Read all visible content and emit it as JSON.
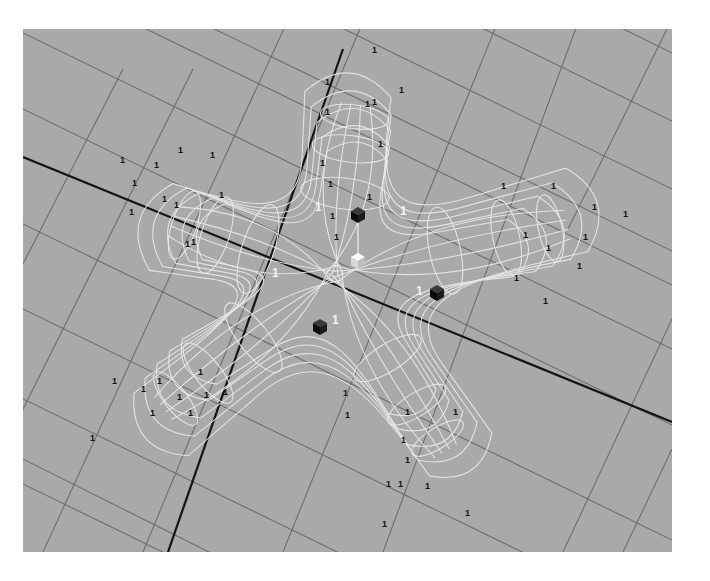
{
  "viewport": {
    "name": "perspective-viewport",
    "background": "#a9a9a9",
    "grid_color": "#6e6e6e",
    "axis_color": "#141414",
    "wire_color": "#e8e8e8"
  },
  "grid": {
    "lines": [
      [
        0,
        4,
        649,
        320
      ],
      [
        0,
        80,
        649,
        396
      ],
      [
        0,
        195,
        649,
        511
      ],
      [
        0,
        280,
        649,
        596
      ],
      [
        0,
        370,
        649,
        686
      ],
      [
        0,
        455,
        649,
        771
      ],
      [
        150,
        -20,
        649,
        222
      ],
      [
        280,
        -20,
        649,
        160
      ],
      [
        420,
        -20,
        649,
        92
      ],
      [
        560,
        -20,
        649,
        24
      ],
      [
        0,
        -60,
        649,
        256
      ],
      [
        -200,
        330,
        200,
        530
      ],
      [
        0,
        235,
        100,
        40
      ],
      [
        0,
        380,
        170,
        40
      ],
      [
        20,
        523,
        270,
        -20
      ],
      [
        120,
        523,
        345,
        -20
      ],
      [
        260,
        523,
        480,
        -20
      ],
      [
        360,
        523,
        560,
        -20
      ],
      [
        540,
        523,
        649,
        290
      ],
      [
        600,
        523,
        649,
        420
      ],
      [
        545,
        200,
        649,
        -10
      ]
    ],
    "axes": [
      [
        0,
        128,
        649,
        393
      ],
      [
        145,
        523,
        320,
        20
      ]
    ]
  },
  "starfish": {
    "center": [
      312,
      245
    ],
    "arms": [
      {
        "angle": -83,
        "length": 180,
        "width": 48
      },
      {
        "angle": -12,
        "length": 250,
        "width": 48
      },
      {
        "angle": 58,
        "length": 220,
        "width": 42
      },
      {
        "angle": 142,
        "length": 230,
        "width": 46
      },
      {
        "angle": 198,
        "length": 180,
        "width": 50
      }
    ],
    "layers": 5
  },
  "handles": [
    {
      "name": "cube-handle-black-top",
      "x": 335,
      "y": 186,
      "color": "#111111"
    },
    {
      "name": "cube-handle-white-center",
      "x": 335,
      "y": 232,
      "color": "#f2f2f2"
    },
    {
      "name": "cube-handle-black-right",
      "x": 414,
      "y": 264,
      "color": "#111111"
    },
    {
      "name": "cube-handle-black-left",
      "x": 297,
      "y": 298,
      "color": "#111111"
    }
  ],
  "pivot_line": [
    335,
    190,
    335,
    232
  ],
  "cv_labels": {
    "text": "1",
    "black": [
      [
        349,
        24
      ],
      [
        302,
        56
      ],
      [
        349,
        76
      ],
      [
        376,
        64
      ],
      [
        302,
        86
      ],
      [
        355,
        118
      ],
      [
        297,
        137
      ],
      [
        307,
        190
      ],
      [
        342,
        78
      ],
      [
        305,
        158
      ],
      [
        97,
        134
      ],
      [
        131,
        139
      ],
      [
        155,
        124
      ],
      [
        187,
        129
      ],
      [
        106,
        186
      ],
      [
        139,
        173
      ],
      [
        151,
        179
      ],
      [
        196,
        169
      ],
      [
        109,
        157
      ],
      [
        162,
        218
      ],
      [
        168,
        216
      ],
      [
        478,
        160
      ],
      [
        528,
        160
      ],
      [
        569,
        181
      ],
      [
        600,
        188
      ],
      [
        560,
        211
      ],
      [
        500,
        209
      ],
      [
        523,
        222
      ],
      [
        554,
        240
      ],
      [
        491,
        252
      ],
      [
        520,
        275
      ],
      [
        89,
        355
      ],
      [
        118,
        363
      ],
      [
        134,
        355
      ],
      [
        154,
        371
      ],
      [
        175,
        346
      ],
      [
        165,
        387
      ],
      [
        181,
        369
      ],
      [
        200,
        366
      ],
      [
        127,
        387
      ],
      [
        67,
        412
      ],
      [
        382,
        386
      ],
      [
        378,
        414
      ],
      [
        382,
        434
      ],
      [
        363,
        458
      ],
      [
        375,
        458
      ],
      [
        359,
        498
      ],
      [
        402,
        460
      ],
      [
        442,
        487
      ],
      [
        430,
        386
      ],
      [
        320,
        367
      ],
      [
        322,
        389
      ],
      [
        311,
        211
      ],
      [
        344,
        171
      ]
    ],
    "white": [
      [
        292,
        182
      ],
      [
        377,
        186
      ],
      [
        249,
        248
      ],
      [
        393,
        266
      ],
      [
        309,
        295
      ]
    ]
  }
}
